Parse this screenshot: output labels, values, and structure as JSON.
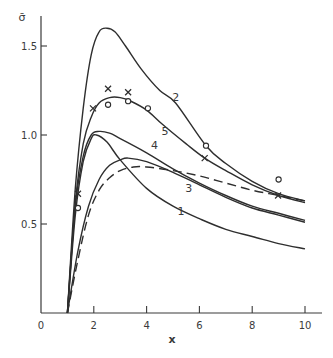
{
  "chart_data": {
    "type": "line",
    "title": "",
    "xlabel": "x",
    "ylabel": "σ̄",
    "xlim": [
      0,
      10.5
    ],
    "ylim": [
      0,
      1.7
    ],
    "xticks": [
      0,
      2,
      4,
      6,
      8,
      10
    ],
    "xtick_labels": [
      "0",
      "2",
      "4",
      "6",
      "8",
      "10"
    ],
    "yticks": [
      0.5,
      1.0,
      1.5
    ],
    "ytick_labels": [
      "0.5",
      "1.0",
      "1.5"
    ],
    "grid": false,
    "legend": "none (curves labeled inline)",
    "series": [
      {
        "name": "1",
        "style": "solid",
        "x": [
          1.0,
          1.3,
          1.6,
          1.9,
          2.1,
          2.5,
          3.0,
          4.0,
          5.0,
          6.0,
          7.0,
          8.0,
          9.0,
          10.0
        ],
        "y": [
          0.0,
          0.55,
          0.85,
          0.98,
          1.0,
          0.96,
          0.86,
          0.7,
          0.6,
          0.53,
          0.47,
          0.43,
          0.39,
          0.36
        ],
        "label_pos": [
          5.3,
          0.55
        ]
      },
      {
        "name": "2",
        "style": "solid",
        "x": [
          1.0,
          1.3,
          1.6,
          1.9,
          2.2,
          2.5,
          2.8,
          3.2,
          3.8,
          4.5,
          5.1,
          6.25,
          7.0,
          8.0,
          9.0,
          10.0
        ],
        "y": [
          0.0,
          0.7,
          1.15,
          1.45,
          1.58,
          1.6,
          1.58,
          1.5,
          1.37,
          1.25,
          1.18,
          0.94,
          0.84,
          0.74,
          0.67,
          0.63
        ],
        "label_pos": [
          5.1,
          1.19
        ]
      },
      {
        "name": "3",
        "style": "solid",
        "x": [
          1.0,
          1.4,
          1.8,
          2.2,
          2.6,
          3.0,
          3.3,
          4.0,
          5.0,
          6.0,
          7.0,
          8.0,
          9.0,
          10.0
        ],
        "y": [
          0.0,
          0.35,
          0.6,
          0.75,
          0.83,
          0.86,
          0.87,
          0.85,
          0.79,
          0.72,
          0.65,
          0.59,
          0.55,
          0.51
        ],
        "label_pos": [
          5.6,
          0.68
        ]
      },
      {
        "name": "4",
        "style": "solid",
        "x": [
          1.0,
          1.3,
          1.6,
          1.9,
          2.2,
          2.6,
          3.0,
          4.0,
          5.0,
          6.0,
          7.0,
          8.0,
          9.0,
          10.0
        ],
        "y": [
          0.0,
          0.6,
          0.88,
          1.0,
          1.02,
          1.01,
          0.98,
          0.9,
          0.81,
          0.73,
          0.66,
          0.6,
          0.56,
          0.52
        ],
        "label_pos": [
          4.3,
          0.92
        ]
      },
      {
        "name": "5",
        "style": "solid",
        "x": [
          1.0,
          1.3,
          1.6,
          1.9,
          2.2,
          2.6,
          3.0,
          3.4,
          4.0,
          4.6,
          5.5,
          6.2,
          7.0,
          8.0,
          9.0,
          10.0
        ],
        "y": [
          0.0,
          0.62,
          0.95,
          1.1,
          1.18,
          1.21,
          1.21,
          1.19,
          1.14,
          1.06,
          0.95,
          0.87,
          0.8,
          0.72,
          0.66,
          0.62
        ],
        "label_pos": [
          4.7,
          1.0
        ]
      },
      {
        "name": "dashed",
        "style": "dashed",
        "x": [
          1.0,
          1.4,
          1.8,
          2.2,
          2.6,
          3.0,
          3.5,
          4.0,
          5.0,
          6.0,
          7.0,
          8.0,
          9.0,
          10.0
        ],
        "y": [
          0.0,
          0.3,
          0.55,
          0.69,
          0.76,
          0.8,
          0.82,
          0.82,
          0.8,
          0.77,
          0.73,
          0.69,
          0.66,
          0.63
        ],
        "label_pos": null
      }
    ],
    "markers": {
      "cross": {
        "symbol": "x",
        "points": [
          [
            1.4,
            0.67
          ],
          [
            1.97,
            1.15
          ],
          [
            2.54,
            1.26
          ],
          [
            3.3,
            1.24
          ],
          [
            6.2,
            0.87
          ],
          [
            8.98,
            0.66
          ]
        ]
      },
      "circle": {
        "symbol": "o",
        "points": [
          [
            1.4,
            0.59
          ],
          [
            2.54,
            1.17
          ],
          [
            3.3,
            1.19
          ],
          [
            4.05,
            1.15
          ],
          [
            6.25,
            0.94
          ],
          [
            9.0,
            0.75
          ]
        ]
      }
    }
  },
  "axes": {
    "x_title": "x",
    "y_title": "σ̄"
  }
}
